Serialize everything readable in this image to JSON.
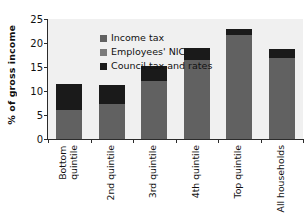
{
  "chart_data": {
    "type": "bar",
    "stacked": true,
    "title": "",
    "xlabel": "",
    "ylabel": "% of gross income",
    "ylim": [
      0,
      25
    ],
    "yticks": [
      0,
      5,
      10,
      15,
      20,
      25
    ],
    "ytick_labels": [
      "0",
      "5",
      "10",
      "15",
      "20",
      "25"
    ],
    "grid": false,
    "legend_position": "top-left",
    "categories": [
      "Bottom\nquintile",
      "2nd quintile",
      "3rd quintile",
      "4th quintile",
      "Top quintile",
      "All households"
    ],
    "series": [
      {
        "name": "Income tax",
        "color": "#616161",
        "values": [
          2.0,
          3.2,
          6.1,
          9.3,
          14.2,
          9.6
        ]
      },
      {
        "name": "Employees' NIC",
        "color": "#7a7a7a",
        "values": [
          4.0,
          4.1,
          6.0,
          7.2,
          7.5,
          7.3
        ]
      },
      {
        "name": "Council tax and rates",
        "color": "#1a1a1a",
        "values": [
          5.4,
          4.0,
          3.1,
          2.5,
          1.2,
          1.9
        ]
      }
    ],
    "totals": [
      11.4,
      11.3,
      15.2,
      19.0,
      22.9,
      18.8
    ],
    "segment_boundaries": [
      6.0,
      7.3,
      12.1,
      16.5,
      21.7,
      16.9
    ]
  },
  "legend": {
    "items": [
      {
        "label": "Income tax",
        "swatch": "income-swatch"
      },
      {
        "label": "Employees' NIC",
        "swatch": "nic-swatch"
      },
      {
        "label": "Council tax and rates",
        "swatch": "council-swatch"
      }
    ]
  },
  "colors": {
    "plot_background": "#f0f0f0",
    "axis": "#2b2b2b",
    "gray_segment": "#616161",
    "black_segment": "#1a1a1a",
    "text": "#111111"
  }
}
